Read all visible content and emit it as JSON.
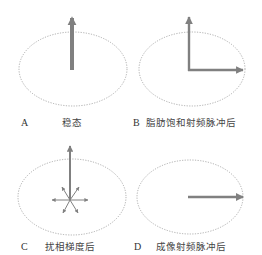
{
  "colors": {
    "vector": "#808080",
    "ellipse": "#999999",
    "text": "#333333"
  },
  "panels": [
    {
      "id": "A",
      "letter": "A",
      "caption": "稳态",
      "description": "Steady state: single longitudinal magnetization vector pointing up",
      "vectors": [
        {
          "name": "longitudinal-magnetization",
          "direction": "up",
          "emphasis": "thick",
          "relative_length": 1.0
        }
      ]
    },
    {
      "id": "B",
      "letter": "B",
      "caption": "脂肪饱和射频脉冲后",
      "description": "After fat-saturation RF pulse: one vector up, one vector tipped to transverse plane",
      "vectors": [
        {
          "name": "longitudinal-magnetization",
          "direction": "up",
          "emphasis": "normal",
          "relative_length": 1.0
        },
        {
          "name": "transverse-fat-magnetization",
          "direction": "right",
          "emphasis": "normal",
          "relative_length": 1.0
        }
      ]
    },
    {
      "id": "C",
      "letter": "C",
      "caption": "扰相梯度后",
      "description": "After spoiler gradient: upward vector remains, transverse components dephased in many directions",
      "vectors": [
        {
          "name": "longitudinal-magnetization",
          "direction": "up",
          "emphasis": "normal",
          "relative_length": 1.0
        },
        {
          "name": "dephased-spin-left",
          "direction": "left",
          "emphasis": "thin",
          "relative_length": 0.35
        },
        {
          "name": "dephased-spin-right",
          "direction": "right",
          "emphasis": "thin",
          "relative_length": 0.35
        },
        {
          "name": "dephased-spin-upper-left",
          "direction": "upper-left",
          "emphasis": "thin",
          "relative_length": 0.35
        },
        {
          "name": "dephased-spin-upper-right",
          "direction": "upper-right",
          "emphasis": "thin",
          "relative_length": 0.35
        },
        {
          "name": "dephased-spin-lower-left",
          "direction": "lower-left",
          "emphasis": "thin",
          "relative_length": 0.35
        },
        {
          "name": "dephased-spin-lower-right",
          "direction": "lower-right",
          "emphasis": "thin",
          "relative_length": 0.35
        }
      ]
    },
    {
      "id": "D",
      "letter": "D",
      "caption": "成像射频脉冲后",
      "description": "After imaging RF pulse: single vector in transverse plane pointing right",
      "vectors": [
        {
          "name": "transverse-magnetization",
          "direction": "right",
          "emphasis": "normal",
          "relative_length": 1.0
        }
      ]
    }
  ]
}
